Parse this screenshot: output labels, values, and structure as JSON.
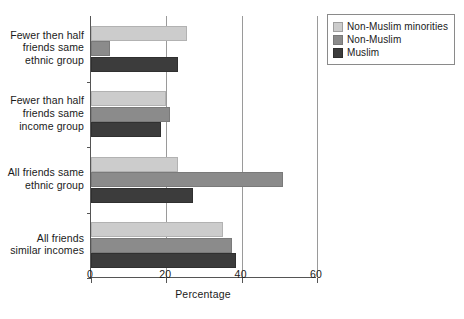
{
  "chart_data": {
    "type": "bar",
    "orientation": "horizontal",
    "title": "",
    "xlabel": "Percentage",
    "ylabel": "",
    "xlim": [
      0,
      60
    ],
    "xticks": [
      0,
      20,
      40,
      60
    ],
    "xtick_labels": [
      "0",
      "20",
      "40",
      "60"
    ],
    "grid": "vertical",
    "legend_position": "top-right",
    "categories": [
      "Fewer then half friends same ethnic group",
      "Fewer than half friends same income group",
      "All friends same ethnic group",
      "All friends similar incomes"
    ],
    "category_lines": [
      [
        "Fewer then half",
        "friends same",
        "ethnic group"
      ],
      [
        "Fewer than half",
        "friends same",
        "income group"
      ],
      [
        "All friends same",
        "ethnic group"
      ],
      [
        "All friends",
        "similar incomes"
      ]
    ],
    "series": [
      {
        "name": "Non-Muslim minorities",
        "color": "#cccccc",
        "values": [
          25.5,
          20,
          23,
          35
        ]
      },
      {
        "name": "Non-Muslim",
        "color": "#8b8b8b",
        "values": [
          5,
          21,
          51,
          37.5
        ]
      },
      {
        "name": "Muslim",
        "color": "#3c3c3c",
        "values": [
          23,
          18.5,
          27,
          38.5
        ]
      }
    ]
  },
  "legend": {
    "items": [
      {
        "label": "Non-Muslim minorities",
        "color": "#cccccc"
      },
      {
        "label": "Non-Muslim",
        "color": "#8b8b8b"
      },
      {
        "label": "Muslim",
        "color": "#3c3c3c"
      }
    ]
  },
  "axis": {
    "x_title": "Percentage",
    "x_tick_labels": [
      "0",
      "20",
      "40",
      "60"
    ]
  }
}
